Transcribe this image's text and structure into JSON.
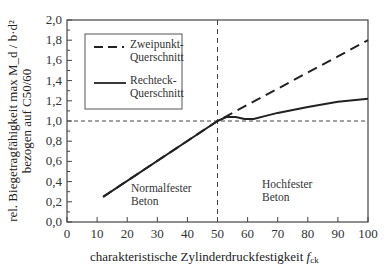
{
  "chart_data": {
    "type": "line",
    "title": "",
    "xlabel": "charakteristische Zylinderdruckfestigkeit",
    "xlabel_symbol": "f",
    "xlabel_subscript": "ck",
    "ylabel_line1": "rel. Biegetragfähigkeit max M_d / b·d²",
    "ylabel_line2": "bezogen auf C50/60",
    "xlim": [
      0,
      100
    ],
    "ylim": [
      0.0,
      2.0
    ],
    "x_ticks": [
      0,
      10,
      20,
      30,
      40,
      50,
      60,
      70,
      80,
      90,
      100
    ],
    "y_ticks": [
      "0,0",
      "0,2",
      "0,4",
      "0,6",
      "0,8",
      "1,0",
      "1,2",
      "1,4",
      "1,6",
      "1,8",
      "2,0"
    ],
    "grid": false,
    "legend_position": "upper left",
    "series": [
      {
        "name": "Zweipunkt-Querschnitt",
        "style": "dashed",
        "points": [
          [
            12,
            0.25
          ],
          [
            50,
            1.0
          ],
          [
            60,
            1.16
          ],
          [
            70,
            1.32
          ],
          [
            80,
            1.48
          ],
          [
            90,
            1.64
          ],
          [
            100,
            1.8
          ]
        ]
      },
      {
        "name": "Rechteck-Querschnitt",
        "style": "solid",
        "points": [
          [
            12,
            0.25
          ],
          [
            50,
            1.0
          ],
          [
            53,
            1.04
          ],
          [
            56,
            1.04
          ],
          [
            59,
            1.02
          ],
          [
            62,
            1.02
          ],
          [
            66,
            1.05
          ],
          [
            70,
            1.08
          ],
          [
            80,
            1.14
          ],
          [
            90,
            1.19
          ],
          [
            100,
            1.22
          ]
        ]
      }
    ],
    "reference_lines": [
      {
        "orientation": "horizontal",
        "value": 1.0,
        "style": "dashed"
      },
      {
        "orientation": "vertical",
        "value": 50,
        "style": "dashed"
      }
    ],
    "annotations": [
      {
        "text_line1": "Normalfester",
        "text_line2": "Beton",
        "x": 22,
        "y": 0.3
      },
      {
        "text_line1": "Hochfester",
        "text_line2": "Beton",
        "x": 62,
        "y": 0.3
      }
    ]
  },
  "legend": {
    "items": [
      {
        "line1": "Zweipunkt-",
        "line2": "Querschnitt"
      },
      {
        "line1": "Rechteck-",
        "line2": "Querschnitt"
      }
    ]
  },
  "colors": {
    "line": "#222222",
    "axis": "#444444"
  }
}
